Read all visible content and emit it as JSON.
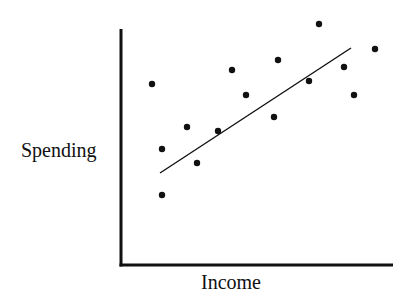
{
  "chart_data": {
    "type": "scatter",
    "title": "",
    "xlabel": "Income",
    "ylabel": "Spending",
    "grid": false,
    "legend": null,
    "ticks": "none",
    "xlim": [
      0,
      100
    ],
    "ylim": [
      0,
      100
    ],
    "points": [
      {
        "x": 11,
        "y": 77
      },
      {
        "x": 15,
        "y": 49
      },
      {
        "x": 15,
        "y": 30
      },
      {
        "x": 24,
        "y": 59
      },
      {
        "x": 28,
        "y": 43
      },
      {
        "x": 36,
        "y": 57
      },
      {
        "x": 41,
        "y": 83
      },
      {
        "x": 46,
        "y": 72
      },
      {
        "x": 56,
        "y": 62
      },
      {
        "x": 57,
        "y": 87
      },
      {
        "x": 69,
        "y": 78
      },
      {
        "x": 73,
        "y": 102
      },
      {
        "x": 82,
        "y": 84
      },
      {
        "x": 86,
        "y": 72
      },
      {
        "x": 93,
        "y": 92
      }
    ],
    "trendline": {
      "type": "linear",
      "x0": 14,
      "y0": 39,
      "x1": 85,
      "y1": 92
    },
    "pixel_points": [
      [
        152,
        84
      ],
      [
        162,
        149
      ],
      [
        162,
        195
      ],
      [
        187,
        127
      ],
      [
        197,
        163
      ],
      [
        218,
        131
      ],
      [
        232,
        70
      ],
      [
        246,
        95
      ],
      [
        274,
        117
      ],
      [
        278,
        60
      ],
      [
        309,
        81
      ],
      [
        319,
        24
      ],
      [
        344,
        67
      ],
      [
        354,
        95
      ],
      [
        375,
        49
      ]
    ],
    "pixel_trendline": [
      160,
      173,
      351,
      48
    ],
    "pixel_axes": {
      "x0": 121,
      "y_top": 29,
      "y0": 265,
      "x_end": 393
    }
  },
  "colors": {
    "ink": "#111111",
    "background": "#ffffff"
  }
}
